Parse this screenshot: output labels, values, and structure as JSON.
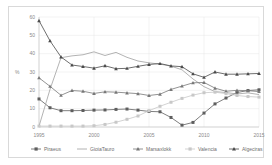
{
  "chart_data": {
    "type": "line",
    "title": "",
    "xlabel": "",
    "ylabel": "%",
    "xlim": [
      1995,
      2015
    ],
    "ylim": [
      0,
      60
    ],
    "yticks": [
      0,
      10,
      20,
      30,
      40,
      50,
      60
    ],
    "xticks": [
      1995,
      2000,
      2005,
      2010,
      2015
    ],
    "xtick_labels": [
      "1995",
      "2000",
      "2005",
      "2010",
      "2015"
    ],
    "ytick_labels": [
      "0",
      "10",
      "20",
      "30",
      "40",
      "50",
      "60"
    ],
    "grid": true,
    "legend_position": "bottom",
    "x": [
      1995,
      1996,
      1997,
      1998,
      1999,
      2000,
      2001,
      2002,
      2003,
      2004,
      2005,
      2006,
      2007,
      2008,
      2009,
      2010,
      2011,
      2012,
      2013,
      2014,
      2015
    ],
    "series": [
      {
        "name": "Piraeus",
        "color": "#5e5e5e",
        "marker": "square",
        "values": [
          15.3,
          10.5,
          8.9,
          8.9,
          9.0,
          9.2,
          9.3,
          9.6,
          9.8,
          9.2,
          8.5,
          8.3,
          5.2,
          1.0,
          2.5,
          7.6,
          12.6,
          15.8,
          18.8,
          19.9,
          20.3
        ]
      },
      {
        "name": "GioiaTauro",
        "color": "#a0a0a0",
        "marker": "none",
        "values": [
          0.4,
          20.5,
          37.8,
          38.8,
          39.4,
          41.0,
          39.0,
          40.7,
          38.0,
          36.0,
          35.0,
          34.3,
          33.2,
          31.2,
          26.2,
          22.0,
          19.3,
          18.8,
          18.0,
          18.6,
          17.7
        ]
      },
      {
        "name": "Marsaxlokk",
        "color": "#777777",
        "marker": "triangle",
        "values": [
          26.8,
          22.2,
          17.3,
          19.9,
          19.5,
          18.3,
          19.2,
          19.0,
          18.6,
          18.2,
          17.2,
          17.9,
          20.5,
          22.3,
          24.1,
          24.3,
          21.2,
          19.5,
          20.0,
          19.8,
          19.3
        ]
      },
      {
        "name": "Valencia",
        "color": "#c8c8c8",
        "marker": "square",
        "values": [
          0.5,
          0.5,
          0.5,
          0.5,
          0.5,
          0.7,
          1.4,
          2.6,
          4.2,
          6.0,
          8.9,
          11.3,
          13.5,
          15.6,
          17.4,
          18.7,
          19.0,
          18.2,
          17.2,
          16.6,
          16.3
        ]
      },
      {
        "name": "Algeciras",
        "color": "#4a4a4a",
        "marker": "triangle",
        "values": [
          58.0,
          47.0,
          38.2,
          33.8,
          33.0,
          32.1,
          33.4,
          31.8,
          32.0,
          33.1,
          34.1,
          34.6,
          33.3,
          32.9,
          29.0,
          27.1,
          30.0,
          28.8,
          28.8,
          29.0,
          29.2
        ]
      }
    ]
  }
}
